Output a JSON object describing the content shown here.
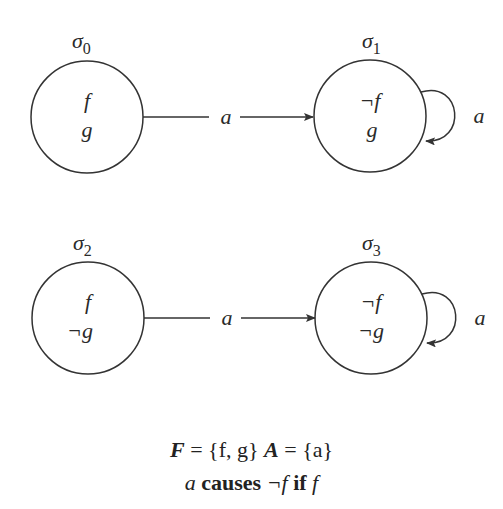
{
  "diagram": {
    "states": [
      {
        "id": "sigma0",
        "label": "σ",
        "sub": "0",
        "cx": 87,
        "cy": 117,
        "r": 56,
        "fluents": [
          "f",
          "g"
        ]
      },
      {
        "id": "sigma1",
        "label": "σ",
        "sub": "1",
        "cx": 370,
        "cy": 116,
        "r": 56,
        "fluents": [
          "¬f",
          "g"
        ]
      },
      {
        "id": "sigma2",
        "label": "σ",
        "sub": "2",
        "cx": 88,
        "cy": 318,
        "r": 56,
        "fluents": [
          "f",
          "¬g"
        ]
      },
      {
        "id": "sigma3",
        "label": "σ",
        "sub": "3",
        "cx": 371,
        "cy": 318,
        "r": 56,
        "fluents": [
          "¬f",
          "¬g"
        ]
      }
    ],
    "transitions": [
      {
        "from": "sigma0",
        "to": "sigma1",
        "label": "a"
      },
      {
        "from": "sigma1",
        "to": "sigma1",
        "label": "a"
      },
      {
        "from": "sigma2",
        "to": "sigma3",
        "label": "a"
      },
      {
        "from": "sigma3",
        "to": "sigma3",
        "label": "a"
      }
    ],
    "stroke_color": "#333333"
  },
  "caption": {
    "line1": {
      "fluent_set_symbol": "F",
      "fluent_set_value": "= {f, g}",
      "action_set_symbol": "A",
      "action_set_value": "= {a}"
    },
    "line2": {
      "action": "a",
      "causes_keyword": "causes",
      "effect": "¬f",
      "if_keyword": "if",
      "condition": "f"
    }
  }
}
